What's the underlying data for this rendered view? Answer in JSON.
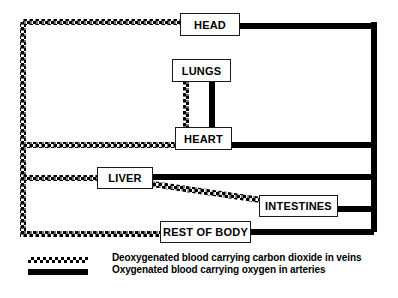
{
  "diagram": {
    "organs": [
      {
        "id": "head",
        "label": "HEAD",
        "x": 180,
        "y": 13,
        "w": 60,
        "h": 23,
        "font": 11
      },
      {
        "id": "lungs",
        "label": "LUNGS",
        "x": 172,
        "y": 59,
        "w": 59,
        "h": 23,
        "font": 11
      },
      {
        "id": "heart",
        "label": "HEART",
        "x": 175,
        "y": 127,
        "w": 57,
        "h": 23,
        "font": 11
      },
      {
        "id": "liver",
        "label": "LIVER",
        "x": 97,
        "y": 167,
        "w": 56,
        "h": 22,
        "font": 11
      },
      {
        "id": "intestines",
        "label": "INTESTINES",
        "x": 259,
        "y": 195,
        "w": 79,
        "h": 22,
        "font": 11
      },
      {
        "id": "rest_of_body",
        "label": "REST OF BODY",
        "x": 160,
        "y": 221,
        "w": 91,
        "h": 22,
        "font": 11
      }
    ],
    "colors": {
      "vein": "#000000",
      "artery": "#000000",
      "box_border": "#1a1a1a",
      "background": "#ffffff"
    }
  },
  "legend": {
    "items": [
      {
        "id": "vein",
        "style": "dotted",
        "text": "Deoxygenated blood carrying carbon dioxide in veins"
      },
      {
        "id": "artery",
        "style": "solid",
        "text": "Oxygenated blood carrying oxygen in arteries"
      }
    ],
    "swatch_x": 28,
    "swatch_w": 60,
    "text_x": 112,
    "rows_y": [
      257,
      269
    ]
  },
  "vessels": {
    "veins": [
      {
        "id": "vein-trunk-left",
        "points": "23,22 23,237"
      },
      {
        "id": "vein-head-to-trunk",
        "points": "23,22 182,22"
      },
      {
        "id": "vein-trunk-to-heart",
        "points": "23,145 177,145"
      },
      {
        "id": "vein-trunk-to-liver",
        "points": "23,178 99,178"
      },
      {
        "id": "vein-trunk-to-restofbody",
        "points": "23,234 162,234"
      },
      {
        "id": "vein-lungs-to-heart",
        "points": "186,82 186,128"
      },
      {
        "id": "vein-liver-to-intestines",
        "points": "152,184 261,200"
      }
    ],
    "arteries": [
      {
        "id": "artery-trunk-right",
        "points": "374,22 374,232"
      },
      {
        "id": "artery-head-to-trunk",
        "points": "238,26 374,26"
      },
      {
        "id": "artery-heart-to-lungs",
        "points": "212,82 212,128"
      },
      {
        "id": "artery-heart-to-trunk",
        "points": "230,145 374,145"
      },
      {
        "id": "artery-liver-to-trunk",
        "points": "151,177 374,177"
      },
      {
        "id": "artery-intestines-to-trunk",
        "points": "336,209 374,209"
      },
      {
        "id": "artery-restofbody-to-trunk",
        "points": "249,232 374,232"
      }
    ]
  }
}
